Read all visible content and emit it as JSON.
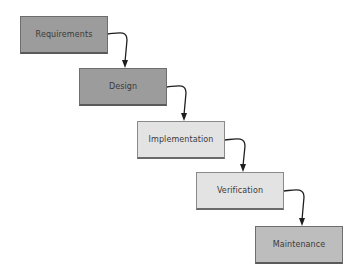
{
  "diagram": {
    "type": "waterfall",
    "phases": [
      {
        "label": "Requirements",
        "fill": "#9c9c9c",
        "x": 20,
        "y": 16,
        "w": 88,
        "h": 38
      },
      {
        "label": "Design",
        "fill": "#9c9c9c",
        "x": 79,
        "y": 68,
        "w": 88,
        "h": 38
      },
      {
        "label": "Implementation",
        "fill": "#e3e3e3",
        "x": 137,
        "y": 121,
        "w": 88,
        "h": 38
      },
      {
        "label": "Verification",
        "fill": "#e3e3e3",
        "x": 196,
        "y": 172,
        "w": 88,
        "h": 38
      },
      {
        "label": "Maintenance",
        "fill": "#bdbdbd",
        "x": 255,
        "y": 226,
        "w": 88,
        "h": 38
      }
    ],
    "connectors": [
      {
        "from": "Requirements",
        "to": "Design"
      },
      {
        "from": "Design",
        "to": "Implementation"
      },
      {
        "from": "Implementation",
        "to": "Verification"
      },
      {
        "from": "Verification",
        "to": "Maintenance"
      }
    ]
  }
}
